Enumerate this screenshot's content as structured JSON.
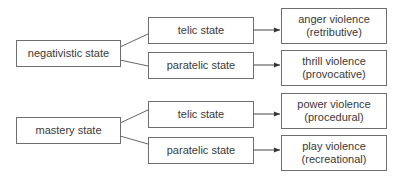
{
  "diagram": {
    "type": "flow",
    "groups": [
      {
        "source": "negativistic state",
        "branches": [
          {
            "state": "telic state",
            "outcome_line1": "anger violence",
            "outcome_line2": "(retributive)"
          },
          {
            "state": "paratelic state",
            "outcome_line1": "thrill violence",
            "outcome_line2": "(provocative)"
          }
        ]
      },
      {
        "source": "mastery state",
        "branches": [
          {
            "state": "telic state",
            "outcome_line1": "power violence",
            "outcome_line2": "(procedural)"
          },
          {
            "state": "paratelic state",
            "outcome_line1": "play violence",
            "outcome_line2": "(recreational)"
          }
        ]
      }
    ],
    "colors": {
      "border": "#6e6e6e",
      "line": "#555555",
      "text": "#3a3a3a",
      "background": "#ffffff"
    }
  }
}
